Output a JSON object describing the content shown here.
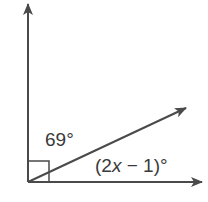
{
  "diagram": {
    "type": "angle-diagram",
    "colors": {
      "stroke": "#4a4a4a",
      "text": "#3a3a3a",
      "background": "#ffffff"
    },
    "vertex": {
      "x": 28,
      "y": 182
    },
    "rays": [
      {
        "name": "vertical-ray",
        "to": {
          "x": 28,
          "y": 3
        }
      },
      {
        "name": "diagonal-ray",
        "to": {
          "x": 187,
          "y": 107
        }
      },
      {
        "name": "horizontal-ray",
        "to": {
          "x": 203,
          "y": 182
        }
      }
    ],
    "right_angle_marker": {
      "size": 21
    },
    "labels": {
      "upper_angle": "69°",
      "lower_angle_open": "(2",
      "lower_angle_var": "x",
      "lower_angle_rest": " − 1)°"
    }
  }
}
